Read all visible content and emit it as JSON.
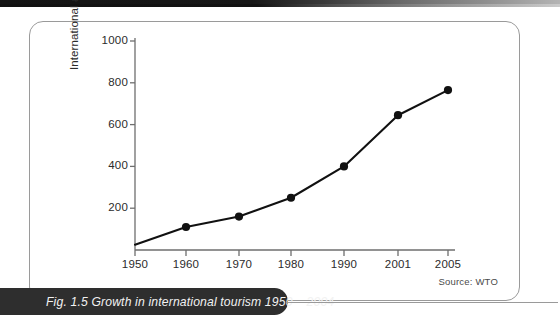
{
  "figure": {
    "caption": "Fig. 1.5 Growth in international tourism 1950 – 2004",
    "source_note": "Source: WTO"
  },
  "chart_data": {
    "type": "line",
    "title": "",
    "xlabel": "",
    "ylabel": "International arrivals (m)",
    "x": [
      1950,
      1960,
      1970,
      1980,
      1990,
      2001,
      2005
    ],
    "xtick_labels": [
      "1950",
      "1960",
      "1970",
      "1980",
      "1990",
      "2001",
      "2005"
    ],
    "values": [
      25,
      110,
      160,
      250,
      400,
      645,
      765
    ],
    "ytick_labels": [
      "200",
      "400",
      "600",
      "800",
      "1000"
    ],
    "yticks": [
      200,
      400,
      600,
      800,
      1000
    ],
    "ylim": [
      0,
      1050
    ],
    "grid": false,
    "legend": false,
    "marker": "filled-circle",
    "line_color": "#111111",
    "marker_color": "#111111",
    "axis_color": "#6e6e6e"
  }
}
